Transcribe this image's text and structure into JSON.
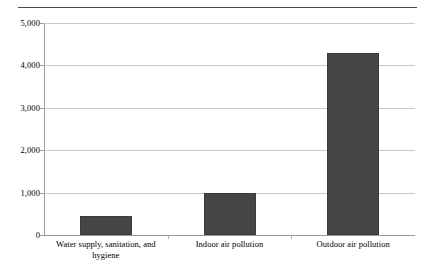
{
  "chart_data": {
    "type": "bar",
    "title": "",
    "subtitle": "",
    "xlabel": "",
    "ylabel": "",
    "categories": [
      "Water supply, sanitation, and hygiene",
      "Indoor air pollution",
      "Outdoor air pollution"
    ],
    "category_lines": [
      [
        "Water supply, sanitation, and",
        "hygiene"
      ],
      [
        "Indoor air pollution"
      ],
      [
        "Outdoor air pollution"
      ]
    ],
    "values": [
      450,
      1000,
      4300
    ],
    "ylim": [
      0,
      5000
    ],
    "ytick_values": [
      0,
      1000,
      2000,
      3000,
      4000,
      5000
    ],
    "ytick_labels": [
      "0",
      "1,000",
      "2,000",
      "3,000",
      "4,000",
      "5,000"
    ],
    "grid": "horizontal",
    "legend": "none",
    "bar_color": "#454545",
    "gridline_color": "#c8c8c8",
    "axis_color": "#9a9a9a",
    "background_color": "#ffffff"
  },
  "figure": {
    "top_rule_color": "#4a4a4a"
  }
}
